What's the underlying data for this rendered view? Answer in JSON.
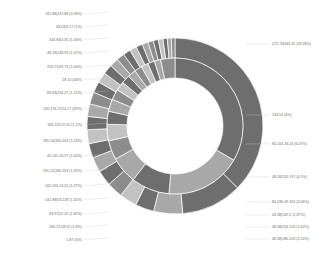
{
  "chart_data": {
    "type": "pie",
    "variant": "nested-donut",
    "title": "",
    "subtitle": "",
    "xlabel": "",
    "ylabel": "",
    "legend_position": "none",
    "grid": false,
    "geometry": {
      "center_x": 175,
      "center_y": 126,
      "inner_radius": 48,
      "mid_radius": 68,
      "outer_radius": 88,
      "start_angle_deg": -90,
      "direction": "clockwise"
    },
    "palette": [
      "#6e6e6e",
      "#a8a8a8",
      "#8c8c8c",
      "#c2c2c2",
      "#5f5f5f",
      "#9b9b9b",
      "#bdbdbd",
      "#777777"
    ],
    "rings": [
      {
        "name": "inner",
        "label": "Inner ring",
        "series": [
          {
            "label": "272.70|343.35 (33.38%)",
            "value": 33.38,
            "color": "#6e6e6e"
          },
          {
            "label": "194.54|272.70 (18.05%)",
            "value": 18.05,
            "color": "#a8a8a8"
          },
          {
            "label": "158.61|194.54 (9.10%)",
            "value": 9.1,
            "color": "#6e6e6e"
          },
          {
            "label": "133.83|158.61 (6.42%)",
            "value": 6.42,
            "color": "#a8a8a8"
          },
          {
            "label": "118.27|133.83 (4.55%)",
            "value": 4.55,
            "color": "#8c8c8c"
          },
          {
            "label": "105.34|118.27 (3.90%)",
            "value": 3.9,
            "color": "#c2c2c2"
          },
          {
            "label": "95.54|105.34 (3.10%)",
            "value": 3.1,
            "color": "#6e6e6e"
          },
          {
            "label": "85.68|95.54 (2.92%)",
            "value": 2.92,
            "color": "#a8a8a8"
          },
          {
            "label": "77.31|85.68 (2.48%)",
            "value": 2.48,
            "color": "#8c8c8c"
          },
          {
            "label": "70.12|77.31 (2.16%)",
            "value": 2.16,
            "color": "#c2c2c2"
          },
          {
            "label": "63.44|70.12 (2.03%)",
            "value": 2.03,
            "color": "#6e6e6e"
          },
          {
            "label": "57.18|63.44 (1.92%)",
            "value": 1.92,
            "color": "#a8a8a8"
          },
          {
            "label": "51.20|57.18 (1.78%)",
            "value": 1.78,
            "color": "#8c8c8c"
          },
          {
            "label": "45.10|51.20 (1.71%)",
            "value": 1.71,
            "color": "#c2c2c2"
          },
          {
            "label": "38.04|45.10 (1.60%)",
            "value": 1.6,
            "color": "#6e6e6e"
          },
          {
            "label": "30.00|38.04 (1.49%)",
            "value": 1.49,
            "color": "#a8a8a8"
          },
          {
            "label": "0.00|30.00 (3.41%)",
            "value": 3.41,
            "color": "#8c8c8c"
          }
        ]
      },
      {
        "name": "outer",
        "label": "Outer ring",
        "series": [
          {
            "label": "272.70|343.35 (33.38%)",
            "value": 33.38,
            "color": "#6e6e6e"
          },
          {
            "label": "194.54|272.70 (9.97%)",
            "value": 9.97,
            "color": "#6e6e6e"
          },
          {
            "label": "158.61|194.54 (4.75%)",
            "value": 4.75,
            "color": "#a8a8a8"
          },
          {
            "label": "133.83|158.61 (3.06%)",
            "value": 3.06,
            "color": "#6e6e6e"
          },
          {
            "label": "118.27|133.83 (2.87%)",
            "value": 2.87,
            "color": "#c2c2c2"
          },
          {
            "label": "105.34|118.27 (2.62%)",
            "value": 2.62,
            "color": "#8c8c8c"
          },
          {
            "label": "95.54|105.34 (2.54%)",
            "value": 2.54,
            "color": "#6e6e6e"
          },
          {
            "label": "85.68|95.54 (2.46%)",
            "value": 2.46,
            "color": "#a8a8a8"
          },
          {
            "label": "77.31|85.68 (2.37%)",
            "value": 2.37,
            "color": "#6e6e6e"
          },
          {
            "label": "70.12|77.31 (2.29%)",
            "value": 2.29,
            "color": "#c2c2c2"
          },
          {
            "label": "63.44|70.12 (2.15%)",
            "value": 2.15,
            "color": "#6e6e6e"
          },
          {
            "label": "57.18|63.44 (2.05%)",
            "value": 2.05,
            "color": "#a8a8a8"
          },
          {
            "label": "51.20|57.18 (1.97%)",
            "value": 1.97,
            "color": "#8c8c8c"
          },
          {
            "label": "45.10|51.20 (1.84%)",
            "value": 1.84,
            "color": "#6e6e6e"
          },
          {
            "label": "38.04|45.10 (1.72%)",
            "value": 1.72,
            "color": "#c2c2c2"
          },
          {
            "label": "30.00|38.04 (1.58%)",
            "value": 1.58,
            "color": "#6e6e6e"
          },
          {
            "label": "25.10|30.00 (1.44%)",
            "value": 1.44,
            "color": "#a8a8a8"
          },
          {
            "label": "21.33|25.10 (1.31%)",
            "value": 1.31,
            "color": "#8c8c8c"
          },
          {
            "label": "18.02|21.33 (1.22%)",
            "value": 1.22,
            "color": "#6e6e6e"
          },
          {
            "label": "15.10|18.02 (1.14%)",
            "value": 1.14,
            "color": "#c2c2c2"
          },
          {
            "label": "12.44|15.10 (1.06%)",
            "value": 1.06,
            "color": "#6e6e6e"
          },
          {
            "label": "10.02|12.44 (0.98%)",
            "value": 0.98,
            "color": "#a8a8a8"
          },
          {
            "label": "7.88|10.02 (0.90%)",
            "value": 0.9,
            "color": "#8c8c8c"
          },
          {
            "label": "5.92|7.88 (0.83%)",
            "value": 0.83,
            "color": "#6e6e6e"
          },
          {
            "label": "4.10|5.92 (0.76%)",
            "value": 0.76,
            "color": "#c2c2c2"
          },
          {
            "label": "2.55|4.10 (0.70%)",
            "value": 0.7,
            "color": "#6e6e6e"
          },
          {
            "label": "1.20|2.55 (0.64%)",
            "value": 0.64,
            "color": "#a8a8a8"
          },
          {
            "label": "0.00|1.20 (0.60%)",
            "value": 0.6,
            "color": "#8c8c8c"
          }
        ]
      }
    ],
    "annotations": {
      "left": [
        {
          "text": "345.88|119.88 (0.98%)",
          "x": 82,
          "y": 15,
          "anchor": "end"
        },
        {
          "text": "84.03|3.17 (1%)",
          "x": 82,
          "y": 28,
          "anchor": "end"
        },
        {
          "text": "345.84|0.35 (1.06%)",
          "x": 82,
          "y": 41,
          "anchor": "end"
        },
        {
          "text": "48.28|148.93 (1.07%)",
          "x": 82,
          "y": 54,
          "anchor": "end"
        },
        {
          "text": "228.71|93.73 (1.04%)",
          "x": 82,
          "y": 68,
          "anchor": "end"
        },
        {
          "text": "28.10 (46%)",
          "x": 82,
          "y": 81,
          "anchor": "end"
        },
        {
          "text": "83.83|194.27 (1.12%)",
          "x": 82,
          "y": 94,
          "anchor": "end"
        },
        {
          "text": "149.176.27|54.17 (95%)",
          "x": 82,
          "y": 110,
          "anchor": "end"
        },
        {
          "text": "184.119.07.02 (1.2%)",
          "x": 82,
          "y": 126,
          "anchor": "end"
        },
        {
          "text": "185.54|180.203 (1.23%)",
          "x": 82,
          "y": 142,
          "anchor": "end"
        },
        {
          "text": "45.145.03.97 (1.24%)",
          "x": 82,
          "y": 157,
          "anchor": "end"
        },
        {
          "text": "195.51|180.203 (1.29%)",
          "x": 82,
          "y": 172,
          "anchor": "end"
        },
        {
          "text": "165.196.13.52 (1.27%)",
          "x": 82,
          "y": 187,
          "anchor": "end"
        },
        {
          "text": "141.88|53.228 (1.32%)",
          "x": 82,
          "y": 201,
          "anchor": "end"
        },
        {
          "text": "83.97|22.31 (1.85%)",
          "x": 82,
          "y": 215,
          "anchor": "end"
        },
        {
          "text": "184.23.28.92 (1.8%)",
          "x": 82,
          "y": 228,
          "anchor": "end"
        },
        {
          "text": "5.87 (5%)",
          "x": 82,
          "y": 241,
          "anchor": "end"
        }
      ],
      "right": [
        {
          "text": "272.70|343.35 (33.38%)",
          "x": 272,
          "y": 45,
          "anchor": "start"
        },
        {
          "text": "194.54 (6%)",
          "x": 272,
          "y": 116,
          "anchor": "start"
        },
        {
          "text": "84.104.33.24 (6.07%)",
          "x": 272,
          "y": 145,
          "anchor": "start"
        },
        {
          "text": "48.28|132.197 (4.5%)",
          "x": 272,
          "y": 178,
          "anchor": "start"
        },
        {
          "text": "84.336.49.359 (3.06%)",
          "x": 272,
          "y": 203,
          "anchor": "start"
        },
        {
          "text": "43.38|149.5 (2.87%)",
          "x": 272,
          "y": 216,
          "anchor": "start"
        },
        {
          "text": "48.38|156.103 (2.62%)",
          "x": 272,
          "y": 228,
          "anchor": "start"
        },
        {
          "text": "48.38|186.203 (2.54%)",
          "x": 272,
          "y": 240,
          "anchor": "start"
        }
      ]
    }
  },
  "meta": {
    "background": "#ffffff",
    "label_color": "#6b6b6b",
    "leader_color": "#cccccc",
    "wedge_border": "#ffffff"
  }
}
